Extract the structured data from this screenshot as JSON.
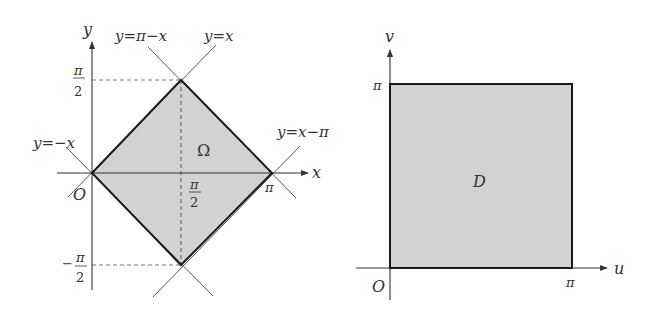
{
  "colors": {
    "fill": "#d2d2d2",
    "boundary": "#1a1a1a",
    "axis": "#333333",
    "guide": "#555555",
    "dashed": "#777777"
  },
  "left_panel": {
    "axis_x_label": "x",
    "axis_y_label": "y",
    "origin_label": "O",
    "region_label": "Ω",
    "tick_pi_label": "π",
    "tick_pi_half_x": {
      "num": "π",
      "den": "2"
    },
    "tick_pi_half_y": {
      "num": "π",
      "den": "2"
    },
    "tick_neg_pi_half_y": {
      "sign": "−",
      "num": "π",
      "den": "2"
    },
    "lines": [
      {
        "label": "y=π−x"
      },
      {
        "label": "y=x"
      },
      {
        "label": "y=−x"
      },
      {
        "label": "y=x−π"
      }
    ]
  },
  "right_panel": {
    "axis_x_label": "u",
    "axis_y_label": "v",
    "origin_label": "O",
    "region_label": "D",
    "tick_u_label": "π",
    "tick_v_label": "π"
  }
}
